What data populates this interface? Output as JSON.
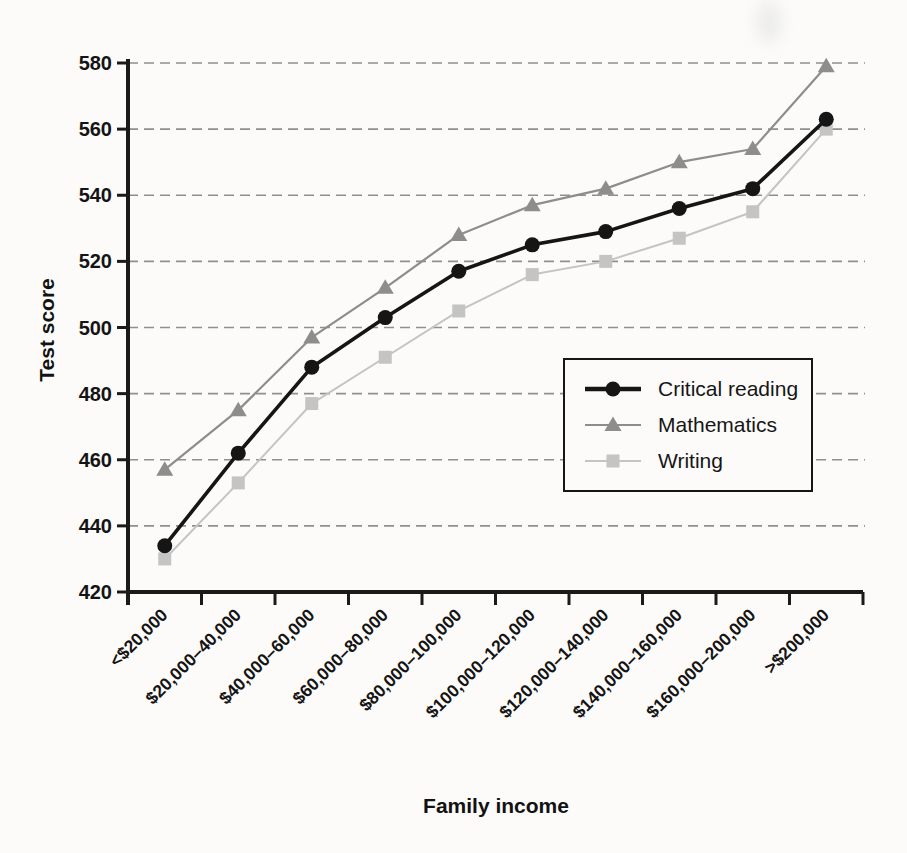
{
  "page": {
    "background": "#fcfbf9"
  },
  "chart_data": {
    "type": "line",
    "title": "",
    "xlabel": "Family income",
    "ylabel": "Test score",
    "categories": [
      "<$20,000",
      "$20,000–40,000",
      "$40,000–60,000",
      "$60,000–80,000",
      "$80,000–100,000",
      "$100,000–120,000",
      "$120,000–140,000",
      "$140,000–160,000",
      "$160,000–200,000",
      ">$200,000"
    ],
    "series": [
      {
        "name": "Critical reading",
        "marker": "circle",
        "color": "#151515",
        "line_width": 3.6,
        "values": [
          434,
          462,
          488,
          503,
          517,
          525,
          529,
          536,
          542,
          563
        ]
      },
      {
        "name": "Mathematics",
        "marker": "triangle",
        "color": "#8d8d8d",
        "line_width": 2.2,
        "values": [
          457,
          475,
          497,
          512,
          528,
          537,
          542,
          550,
          554,
          579
        ]
      },
      {
        "name": "Writing",
        "marker": "square",
        "color": "#c4c4c4",
        "line_width": 2.0,
        "values": [
          430,
          453,
          477,
          491,
          505,
          516,
          520,
          527,
          535,
          560
        ]
      }
    ],
    "ylim": [
      420,
      580
    ],
    "ytick_step": 20,
    "yticks": [
      420,
      440,
      460,
      480,
      500,
      520,
      540,
      560,
      580
    ],
    "grid": "horizontal dashed gridlines at every y tick",
    "grid_color": "#8f8f8f",
    "axis_color": "#1a1a1a",
    "tick_label_color": "#141414",
    "legend_position": "inside lower-right",
    "legend_labels": [
      "Critical reading",
      "Mathematics",
      "Writing"
    ]
  }
}
